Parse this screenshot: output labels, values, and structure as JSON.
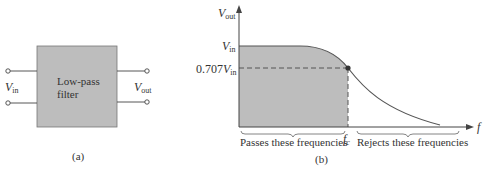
{
  "panel_a": {
    "caption": "(a)",
    "block_label_line1": "Low-pass",
    "block_label_line2": "filter",
    "input_label": {
      "main": "V",
      "sub": "in"
    },
    "output_label": {
      "main": "V",
      "sub": "out"
    }
  },
  "panel_b": {
    "caption": "(b)",
    "y_axis_label": {
      "main": "V",
      "sub": "out"
    },
    "y_tick_vin": {
      "main": "V",
      "sub": "in"
    },
    "y_tick_cutoff": {
      "prefix": "0.707",
      "main": "V",
      "sub": "in"
    },
    "x_axis_label": "f",
    "cutoff_label": {
      "main": "f",
      "sub": "c"
    },
    "passband_label": "Passes these frequencies",
    "stopband_label": "Rejects these frequencies"
  },
  "colors": {
    "fill": "#bdbdbd",
    "line": "#444444",
    "curve": "#555555"
  }
}
